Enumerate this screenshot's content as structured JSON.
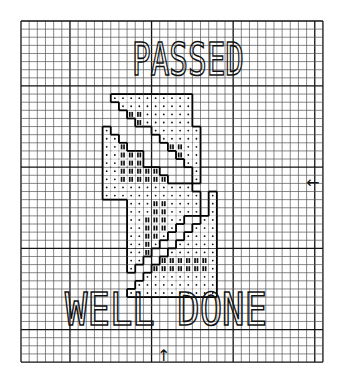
{
  "title": "PASSED",
  "subtitle": "WELL DONE",
  "grid": {
    "x0": 21,
    "y0": 21,
    "cols": 37,
    "rows": 42,
    "cell_w": 8.16,
    "cell_h": 8.12,
    "bold_every": 10,
    "bold_cols": [
      0,
      6,
      16,
      26,
      36
    ],
    "bold_rows": [
      0,
      8,
      18,
      28,
      38
    ],
    "line_color": "#555555",
    "bold_color": "#111111"
  },
  "markers": {
    "right_center": "←",
    "bottom_center": "↑"
  },
  "pattern": {
    "origin_col": 10,
    "origin_row": 9,
    "legend": {
      ".": "dot-stitch",
      "X": "bar-stitch",
      " ": "empty"
    },
    "rows": [
      " ..........   ",
      "  .........   ",
      "   XX......   ",
      "    X......   ",
      ".     ......  ",
      "..     .....  ",
      "..X     XX..  ",
      "..XXX    X..  ",
      "..XXX     ..  ",
      "..XXXXX    .  ",
      "..XXXXXX   .  ",
      "...........   ",
      "............ .",
      "   ...XX.... .",
      "   ...XX.... .",
      "   ..XXX..  ..",
      "   ..XXX.  ...",
      "   ..XX.  ....",
      "   ..X.  .....",
      "   ..X  ......",
      "   ..  XXXXXX.",
      "   .  XXXXXXX.",
      "     .........",
      "    ..........",
      "   ..........."
    ]
  }
}
